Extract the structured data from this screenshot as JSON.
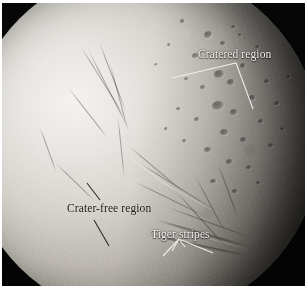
{
  "figure": {
    "background_color": "#050505",
    "frame_color": "#ffffff"
  },
  "annotations": [
    {
      "id": "cratered-region",
      "label": "Cratered region",
      "text_color": "#f2f2ee",
      "style": "light",
      "marker": "bracket"
    },
    {
      "id": "crater-free-region",
      "label": "Crater-free region",
      "text_color": "#191715",
      "style": "dark",
      "marker": "double-slash"
    },
    {
      "id": "tiger-stripes",
      "label": "Tiger stripes",
      "text_color": "#f2f2ee",
      "style": "light",
      "marker": "arrow"
    }
  ],
  "labels": {
    "cratered_region": "Cratered region",
    "crater_free_region": "Crater-free region",
    "tiger_stripes": "Tiger stripes"
  }
}
